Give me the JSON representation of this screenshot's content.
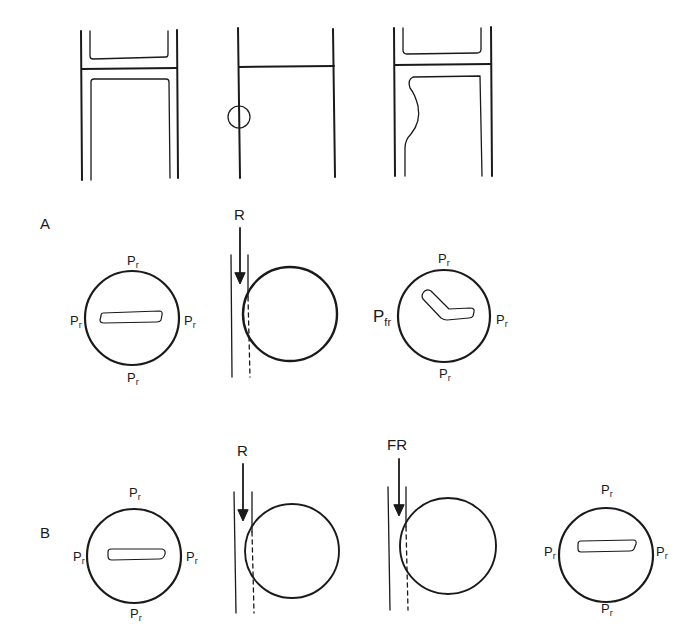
{
  "figure": {
    "rows": [
      {
        "id": "A",
        "label": "A"
      },
      {
        "id": "B",
        "label": "B"
      }
    ],
    "top_panels": [
      {
        "name": "intact-channel-walls",
        "description": "paired walls with junction"
      },
      {
        "name": "wall-with-circled-defect",
        "description": "single line walls, circled site"
      },
      {
        "name": "deformed-channel-walls",
        "description": "walls with bulging inner contour"
      }
    ],
    "force_labels": {
      "A": {
        "arrow": "R"
      },
      "B": {
        "arrow_1": "R",
        "arrow_2": "FR"
      }
    },
    "pressure": {
      "base": "P",
      "sub": "r",
      "fr_sub": "fr"
    },
    "colors": {
      "stroke": "#1a1a1a",
      "background": "#ffffff"
    }
  }
}
